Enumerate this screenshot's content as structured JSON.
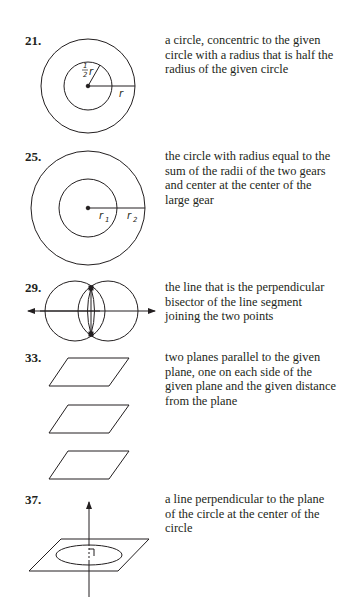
{
  "exercises": [
    {
      "number": "21.",
      "answer": "a circle, concentric to the given circle with a radius that is half the radius of the given circle",
      "figure": {
        "type": "concentric-circles",
        "labels": {
          "inner_radius_fraction": "1",
          "inner_radius_denominator": "2",
          "inner_radius_var": "r",
          "outer_radius": "r"
        }
      }
    },
    {
      "number": "25.",
      "answer": "the circle with radius equal to the sum of the radii of the two gears and center at the center of the large gear",
      "figure": {
        "type": "concentric-circles",
        "labels": {
          "r1": "r",
          "r1_sub": "1",
          "r2": "r",
          "r2_sub": "2"
        }
      }
    },
    {
      "number": "29.",
      "answer": "the line that is the perpendicular bisector of the line segment joining the two points",
      "figure": {
        "type": "perpendicular-bisector-construction"
      }
    },
    {
      "number": "33.",
      "answer": "two planes parallel to the given plane, one on each side of the given plane and the given distance from the plane",
      "figure": {
        "type": "three-parallel-planes"
      }
    },
    {
      "number": "37.",
      "answer": "a line perpendicular to the plane of the circle at the center of the circle",
      "figure": {
        "type": "line-perpendicular-to-plane-of-circle"
      }
    }
  ]
}
